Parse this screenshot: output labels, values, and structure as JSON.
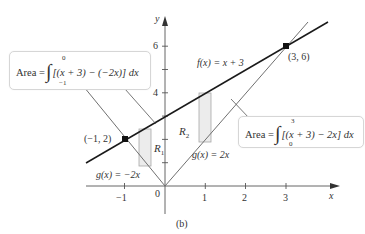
{
  "figure": {
    "caption": "(b)",
    "axes": {
      "x_label": "x",
      "y_label": "y",
      "origin_label": "0",
      "x_ticks": [
        "−1",
        "1",
        "2",
        "3"
      ],
      "y_ticks": [
        "4",
        "6"
      ]
    },
    "curves": {
      "f": {
        "label_fn": "f(x)",
        "label_rhs": " = x + 3",
        "color": "#1a1a1a"
      },
      "g_left": {
        "label_fn": "g(x)",
        "label_rhs": " = −2x",
        "color": "#707070"
      },
      "g_right": {
        "label_fn": "g(x)",
        "label_rhs": " = 2x",
        "color": "#707070"
      }
    },
    "points": [
      {
        "label": "(−1, 2)"
      },
      {
        "label": "(3, 6)"
      }
    ],
    "regions": {
      "r1": {
        "letter": "R",
        "sub": "1"
      },
      "r2": {
        "letter": "R",
        "sub": "2"
      }
    },
    "callouts": {
      "left": {
        "prefix": "Area = ",
        "upper": "0",
        "lower": "−1",
        "integrand": "[(x + 3) − (−2x)] dx"
      },
      "right": {
        "prefix": "Area = ",
        "upper": "3",
        "lower": "0",
        "integrand": "[(x + 3) − 2x] dx"
      }
    },
    "colors": {
      "axis": "#555555",
      "rect_fill": "#ececec",
      "rect_stroke": "#a8a8a8",
      "callout_border": "#d6d6d6"
    }
  }
}
